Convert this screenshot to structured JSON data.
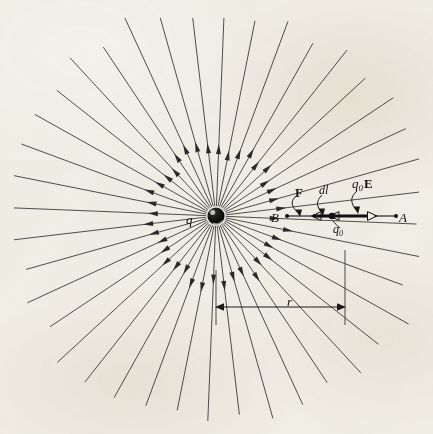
{
  "figure": {
    "background_color": "#f4f2ec",
    "ink_color": "#3a3a3a",
    "label_color": "#14110f"
  },
  "labels": {
    "charge": "q",
    "point_b": "B",
    "point_a": "A",
    "force": "F",
    "displacement": "dl",
    "field_force": "q₀E",
    "field_force_main": "q",
    "field_force_sub": "0",
    "field_force_vector": "E",
    "test_charge": "q₀",
    "test_charge_main": "q",
    "test_charge_sub": "0",
    "radius": "r"
  },
  "chart_data": {
    "type": "diagram",
    "center": {
      "x": 216,
      "y": 216,
      "radius": 8
    },
    "field_lines": {
      "count": 40,
      "inner_start_radius": 10,
      "arrowhead_radius": 66,
      "outer_radius_range": [
        196,
        222
      ],
      "direction": "outward"
    },
    "path": {
      "from": "B",
      "to": "A",
      "y": 216,
      "b_x": 287,
      "a_x": 396,
      "q0_x": 332,
      "segments": [
        {
          "name": "F-arrow",
          "x1": 287,
          "x2": 310,
          "style": "thin",
          "head": "hollow-left"
        },
        {
          "name": "dl-segment",
          "x1": 310,
          "x2": 332,
          "style": "thick",
          "head": "hollow-left"
        },
        {
          "name": "q0E-arrow",
          "x1": 332,
          "x2": 372,
          "style": "thick",
          "head": "hollow-right"
        },
        {
          "name": "A-segment",
          "x1": 372,
          "x2": 396,
          "style": "thin",
          "head": "none"
        }
      ]
    },
    "dimension": {
      "label": "r",
      "y": 307,
      "x1": 216,
      "x2": 345,
      "tick_top_left": 270,
      "tick_top_right": 250,
      "tick_bottom": 325,
      "arrows": "both"
    },
    "axis_ranges": {
      "x": [
        0,
        433
      ],
      "y": [
        0,
        434
      ]
    },
    "grid": false,
    "legend": false
  }
}
